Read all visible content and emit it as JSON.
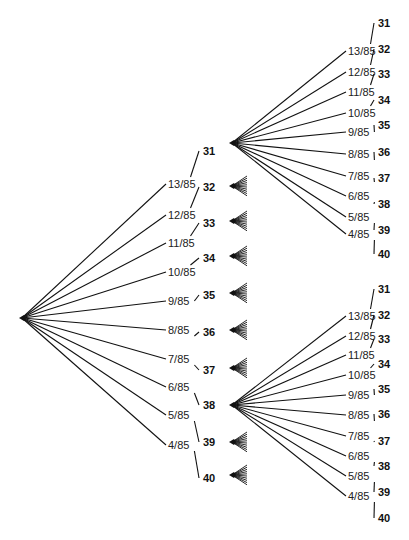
{
  "diagram": {
    "type": "probability-tree",
    "branches": [
      {
        "prob": "13/85",
        "outcome": "31"
      },
      {
        "prob": "12/85",
        "outcome": "32"
      },
      {
        "prob": "11/85",
        "outcome": "33"
      },
      {
        "prob": "10/85",
        "outcome": "34"
      },
      {
        "prob": "9/85",
        "outcome": "35"
      },
      {
        "prob": "8/85",
        "outcome": "36"
      },
      {
        "prob": "7/85",
        "outcome": "37"
      },
      {
        "prob": "6/85",
        "outcome": "38"
      },
      {
        "prob": "5/85",
        "outcome": "39"
      },
      {
        "prob": "4/85",
        "outcome": "40"
      }
    ],
    "trees": [
      {
        "name": "main-tree",
        "root": [
          22,
          318
        ],
        "prob_x": 168,
        "out_x": 203,
        "out_ys": [
          155,
          191,
          227,
          262,
          299,
          336,
          374,
          409,
          446,
          482
        ],
        "prob_ys": [
          187,
          218,
          246,
          275,
          304,
          333,
          362,
          390,
          418,
          448
        ]
      },
      {
        "name": "upper-subtree",
        "root": [
          232,
          143
        ],
        "prob_x": 348,
        "out_x": 378,
        "out_ys": [
          27,
          53,
          78,
          104,
          129,
          156,
          182,
          208,
          234,
          258
        ],
        "prob_ys": [
          54,
          75,
          95,
          116,
          135,
          157,
          179,
          199,
          220,
          237
        ]
      },
      {
        "name": "lower-subtree",
        "root": [
          232,
          405
        ],
        "prob_x": 348,
        "out_x": 378,
        "out_ys": [
          293,
          319,
          343,
          368,
          393,
          418,
          445,
          470,
          496,
          522
        ],
        "prob_ys": [
          319,
          339,
          358,
          378,
          398,
          418,
          439,
          459,
          479,
          499
        ]
      }
    ],
    "collapsed_fan_ys": [
      186,
      221,
      256,
      293,
      330,
      368,
      442,
      475
    ]
  }
}
